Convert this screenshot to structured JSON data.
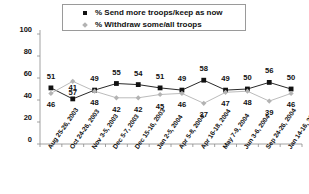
{
  "chart_data": {
    "type": "line",
    "title": "",
    "subtitle": "",
    "xlabel": "",
    "ylabel": "",
    "ylim": [
      0,
      100
    ],
    "yticks": [
      0,
      20,
      40,
      60,
      80,
      100
    ],
    "grid": false,
    "legend_position": "top-center",
    "categories": [
      "Aug 25-26, 2003",
      "Oct 24-26, 2003",
      "Nov 3-5, 2003",
      "Dec 5-7, 2003",
      "Dec 15-16, 2003",
      "Jan 2-5, 2004",
      "Apr 5-8, 2004",
      "Apr 16-18, 2004",
      "May 7-9, 2004",
      "Jun 3-6, 2004",
      "Sep 24-26, 2004",
      "Jan 14-16, 2005"
    ],
    "series": [
      {
        "name": "% Send more troops/keep as now",
        "color": "#111111",
        "marker": "square",
        "values": [
          51,
          41,
          49,
          55,
          54,
          51,
          49,
          58,
          49,
          50,
          56,
          50
        ]
      },
      {
        "name": "% Withdraw some/all troops",
        "color": "#b3b3b3",
        "marker": "diamond",
        "values": [
          46,
          57,
          48,
          42,
          42,
          45,
          46,
          37,
          47,
          48,
          39,
          46
        ]
      }
    ]
  },
  "legend": {
    "items": [
      {
        "label": "% Send more troops/keep as now",
        "marker": "square"
      },
      {
        "label": "% Withdraw some/all troops",
        "marker": "diamond"
      }
    ]
  },
  "axes": {
    "y_tick_labels": [
      "100",
      "80",
      "60",
      "40",
      "20",
      "0"
    ]
  },
  "colors": {
    "series1": "#111111",
    "series2": "#b3b3b3",
    "axis": "#8c8c8c",
    "background": "#ffffff"
  }
}
